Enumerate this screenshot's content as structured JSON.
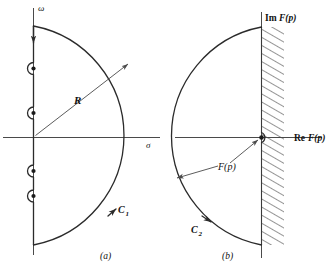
{
  "figure": {
    "background_color": "#ffffff",
    "line_color": "#2b2b2b",
    "axis_color": "#4a4a4a",
    "hatch_color": "#555555"
  },
  "panel_a": {
    "caption": "(a)",
    "vertical_axis_label": "ω",
    "horizontal_axis_label": "σ",
    "radius_label": "R",
    "contour_label": "C",
    "contour_label_sub": "1",
    "pole_count": 4,
    "description": "Closed contour consisting of the imaginary axis indented by small semicircles around four poles, closed by a large semicircular arc of radius R in the right half-plane.",
    "direction": "clockwise along imaginary axis downward, counterclockwise returning on the arc"
  },
  "panel_b": {
    "caption": "(b)",
    "vertical_axis_label_parts": {
      "prefix": "Im",
      "function": "F(p)"
    },
    "horizontal_axis_label_parts": {
      "prefix": "Re",
      "function": "F(p)"
    },
    "mapped_label": "F(p)",
    "contour_label": "C",
    "contour_label_sub": "2",
    "pole_count": 1,
    "description": "Image contour in the F(p)-plane: a large arc in the left half bounded on the right by a hatched vertical strip, with a small indentation around the origin point.",
    "hatched_region": "region to the right of the Im F(p) axis"
  },
  "icons": {
    "arrow_head": "arrowhead-marker",
    "pole_marker": "pole-dot"
  }
}
